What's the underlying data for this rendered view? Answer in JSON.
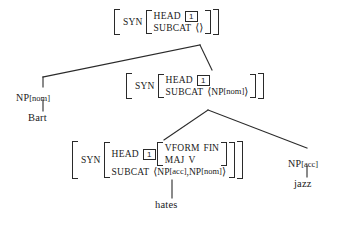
{
  "diagram": {
    "sentence": "Bart hates jazz",
    "ink_color": "#1a1a1a",
    "background_color": "#ffffff"
  },
  "nodes": {
    "root": {
      "outer_attr": "SYN",
      "head_attr": "HEAD",
      "head_tag": "1",
      "subcat_attr": "SUBCAT",
      "subcat_open": "⟨",
      "subcat_value": "",
      "subcat_close": "⟩"
    },
    "vp": {
      "outer_attr": "SYN",
      "head_attr": "HEAD",
      "head_tag": "1",
      "subcat_attr": "SUBCAT",
      "subcat_open": "⟨",
      "subcat_value": "NP",
      "subcat_value_sub": "[nom]",
      "subcat_close": "⟩"
    },
    "v": {
      "outer_attr": "SYN",
      "head_attr": "HEAD",
      "head_tag": "1",
      "vform_attr": "VFORM",
      "vform_value": "FIN",
      "maj_attr": "MAJ",
      "maj_value": "V",
      "subcat_attr": "SUBCAT",
      "subcat_open": "⟨",
      "subcat_item1": "NP",
      "subcat_item1_sub": "[acc]",
      "subcat_sep": ", ",
      "subcat_item2": "NP",
      "subcat_item2_sub": "[nom]",
      "subcat_close": "⟩"
    },
    "np_subject": {
      "category": "NP",
      "feature": "[nom]"
    },
    "np_object": {
      "category": "NP",
      "feature": "[acc]"
    }
  },
  "terminals": {
    "subject_word": "Bart",
    "verb_word": "hates",
    "object_word": "jazz"
  }
}
